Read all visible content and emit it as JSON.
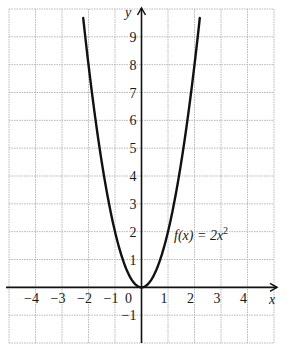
{
  "chart_data": {
    "type": "line",
    "title": "",
    "xlabel": "x",
    "ylabel": "y",
    "xlim": [
      -5,
      5
    ],
    "ylim": [
      -2,
      10
    ],
    "grid": true,
    "x_ticks": [
      -4,
      -3,
      -2,
      -1,
      0,
      1,
      2,
      3,
      4
    ],
    "x_tick_labels": [
      "−4",
      "−3",
      "−2",
      "−1",
      "0",
      "1",
      "2",
      "3",
      "4"
    ],
    "y_ticks": [
      -1,
      1,
      2,
      3,
      4,
      5,
      6,
      7,
      8,
      9
    ],
    "y_tick_labels": [
      "−1",
      "1",
      "2",
      "3",
      "4",
      "5",
      "6",
      "7",
      "8",
      "9"
    ],
    "series": [
      {
        "name": "f(x) = 2x²",
        "function": "2*x^2",
        "x": [
          -2.2,
          -2,
          -1.5,
          -1,
          -0.5,
          0,
          0.5,
          1,
          1.5,
          2,
          2.2
        ],
        "values": [
          9.68,
          8,
          4.5,
          2,
          0.5,
          0,
          0.5,
          2,
          4.5,
          8,
          9.68
        ]
      }
    ],
    "annotations": [
      {
        "text": "f(x) = 2x²",
        "x": 1.3,
        "y": 2
      }
    ],
    "legend": "none"
  },
  "labels": {
    "x_axis": "x",
    "y_axis": "y",
    "func_name": "f(x) = 2x",
    "func_exp": "2"
  },
  "colors": {
    "curve": "#111111",
    "axis": "#111111",
    "grid": "#b8b8b8"
  }
}
